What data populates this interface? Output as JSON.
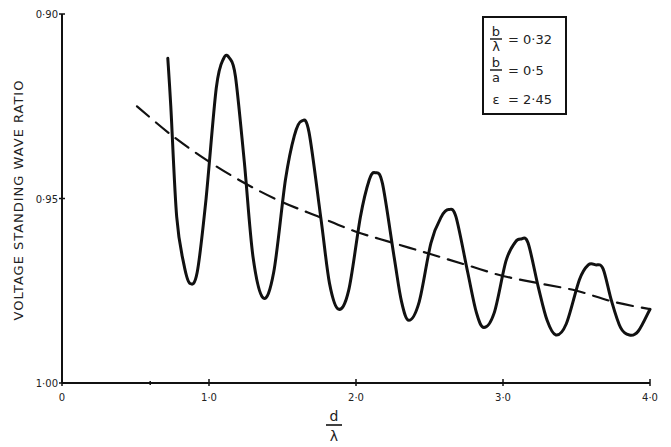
{
  "chart_data": {
    "type": "line",
    "title": "",
    "xlabel": "d/λ",
    "xlabel_numerator": "d",
    "xlabel_denominator": "λ",
    "ylabel": "VOLTAGE STANDING WAVE RATIO",
    "xlim": [
      0,
      4.0
    ],
    "ylim": [
      1.0,
      0.9
    ],
    "y_inverted": true,
    "grid": false,
    "x_ticks": [
      {
        "value": 0,
        "label": "0"
      },
      {
        "value": 1.0,
        "label": "1·0"
      },
      {
        "value": 2.0,
        "label": "2·0"
      },
      {
        "value": 3.0,
        "label": "3·0"
      },
      {
        "value": 4.0,
        "label": "4·0"
      }
    ],
    "x_minor_ticks": [
      0.6
    ],
    "y_ticks": [
      {
        "value": 0.9,
        "label": "0·90"
      },
      {
        "value": 0.95,
        "label": "0·95"
      },
      {
        "value": 1.0,
        "label": "1·00"
      }
    ],
    "legend_box": {
      "position": "top-right",
      "entries": [
        {
          "symbol_num": "b",
          "symbol_den": "λ",
          "eq": "= 0·32"
        },
        {
          "symbol_num": "b",
          "symbol_den": "a",
          "eq": "= 0·5"
        },
        {
          "symbol": "ε",
          "eq": "= 2·45"
        }
      ]
    },
    "series": [
      {
        "name": "measured",
        "style": "solid",
        "x": [
          0.72,
          0.74,
          0.78,
          0.83,
          0.87,
          0.92,
          0.98,
          1.05,
          1.1,
          1.14,
          1.18,
          1.24,
          1.3,
          1.37,
          1.44,
          1.52,
          1.58,
          1.63,
          1.68,
          1.76,
          1.82,
          1.88,
          1.95,
          2.03,
          2.09,
          2.13,
          2.18,
          2.26,
          2.31,
          2.36,
          2.43,
          2.51,
          2.58,
          2.63,
          2.68,
          2.76,
          2.82,
          2.87,
          2.94,
          3.02,
          3.08,
          3.12,
          3.17,
          3.24,
          3.3,
          3.36,
          3.43,
          3.52,
          3.58,
          3.63,
          3.68,
          3.74,
          3.8,
          3.86,
          3.92,
          4.0
        ],
        "values": [
          0.912,
          0.925,
          0.955,
          0.968,
          0.973,
          0.97,
          0.95,
          0.92,
          0.912,
          0.912,
          0.917,
          0.94,
          0.966,
          0.977,
          0.97,
          0.945,
          0.933,
          0.929,
          0.932,
          0.955,
          0.973,
          0.98,
          0.975,
          0.955,
          0.945,
          0.943,
          0.946,
          0.966,
          0.978,
          0.983,
          0.978,
          0.962,
          0.955,
          0.953,
          0.955,
          0.97,
          0.981,
          0.985,
          0.981,
          0.967,
          0.962,
          0.961,
          0.962,
          0.974,
          0.983,
          0.987,
          0.984,
          0.972,
          0.968,
          0.968,
          0.969,
          0.978,
          0.985,
          0.987,
          0.986,
          0.98
        ]
      },
      {
        "name": "mean",
        "style": "dashed",
        "x": [
          0.51,
          0.75,
          1.0,
          1.25,
          1.5,
          1.75,
          2.0,
          2.25,
          2.5,
          2.75,
          3.0,
          3.25,
          3.5,
          3.75,
          4.0
        ],
        "values": [
          0.925,
          0.933,
          0.94,
          0.946,
          0.951,
          0.955,
          0.959,
          0.962,
          0.965,
          0.968,
          0.971,
          0.973,
          0.975,
          0.978,
          0.98
        ]
      }
    ]
  },
  "plot_area": {
    "x0": 62,
    "x1": 650,
    "y_top": 14,
    "y_bottom": 383
  },
  "colors": {
    "ink": "#111111",
    "background": "#ffffff"
  }
}
